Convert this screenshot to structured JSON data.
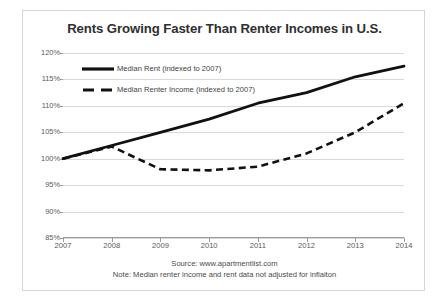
{
  "chart_data": {
    "type": "line",
    "title": "Rents Growing Faster Than Renter Incomes in U.S.",
    "xlabel": "",
    "ylabel": "",
    "categories": [
      "2007",
      "2008",
      "2009",
      "2010",
      "2011",
      "2012",
      "2013",
      "2014"
    ],
    "ylim": [
      85,
      120
    ],
    "ytick_labels": [
      "120%",
      "115%",
      "110%",
      "105%",
      "100%",
      "95%",
      "90%",
      "85%"
    ],
    "ytick_values": [
      120,
      115,
      110,
      105,
      100,
      95,
      90,
      85
    ],
    "grid": true,
    "legend_position": "upper left",
    "series": [
      {
        "name": "Median Rent (indexed to 2007)",
        "style": "solid",
        "color": "#000000",
        "values": [
          100,
          102.5,
          105,
          107.5,
          110.5,
          112.5,
          115.5,
          117.5
        ]
      },
      {
        "name": "Median Renter Income (indexed to 2007)",
        "style": "dashed",
        "color": "#000000",
        "values": [
          100,
          102.3,
          98,
          97.8,
          98.5,
          101,
          105,
          110.5
        ]
      }
    ],
    "annotations": [
      "Source: www.apartmentlist.com",
      "Note: Median renter income and rent data not adjusted for inflaiton"
    ]
  },
  "legend": {
    "items": [
      {
        "label": "Median Rent (indexed to 2007)"
      },
      {
        "label": "Median Renter Income (indexed to 2007)"
      }
    ]
  },
  "footer": {
    "source": "Source: www.apartmentlist.com",
    "note": "Note: Median renter income and rent data not adjusted for inflaiton"
  }
}
